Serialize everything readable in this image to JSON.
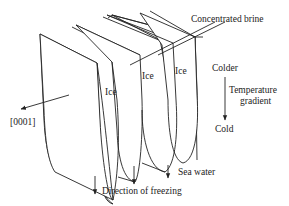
{
  "figure": {
    "type": "schematic"
  },
  "labels": {
    "concentrated_brine": "Concentrated brine",
    "ice_1": "Ice",
    "ice_2": "Ice",
    "ice_3": "Ice",
    "c_axis": "[0001]",
    "colder": "Colder",
    "temperature_gradient_line1": "Temperature",
    "temperature_gradient_line2": "gradient",
    "cold": "Cold",
    "sea_water": "Sea water",
    "direction_of_freezing": "Direction of freezing"
  },
  "colors": {
    "stroke": "#222222",
    "background": "#ffffff"
  }
}
